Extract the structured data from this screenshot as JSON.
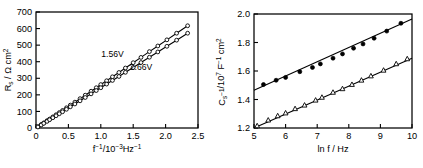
{
  "figure": {
    "background_color": "#ffffff",
    "line_color": "#000000",
    "panels": [
      "series-resistance-plot",
      "series-capacitance-plot"
    ]
  },
  "chart_data": [
    {
      "type": "scatter",
      "name": "series-resistance-plot",
      "title": "",
      "xlabel": "f⁻¹/10⁻³ Hz⁻¹",
      "ylabel": "Rₛ / Ω cm²",
      "xlim": [
        0,
        2.5
      ],
      "ylim": [
        0,
        700
      ],
      "xticks": [
        "0",
        "0.5",
        "1.0",
        "1.5",
        "2.0",
        "2.5"
      ],
      "xtick_values": [
        0,
        0.5,
        1.0,
        1.5,
        2.0,
        2.5
      ],
      "yticks": [
        "0",
        "100",
        "200",
        "300",
        "400",
        "500",
        "600",
        "700"
      ],
      "ytick_values": [
        0,
        100,
        200,
        300,
        400,
        500,
        600,
        700
      ],
      "grid": false,
      "legend_position": "inline-annotation",
      "annotations": [
        {
          "text": "1.56V",
          "x": 1.18,
          "y": 430
        },
        {
          "text": "2.66V",
          "x": 1.62,
          "y": 350
        }
      ],
      "series": [
        {
          "name": "1.56V",
          "marker": "circle-open",
          "label_text": "1.56V",
          "x": [
            0.03,
            0.08,
            0.12,
            0.17,
            0.21,
            0.26,
            0.31,
            0.36,
            0.41,
            0.47,
            0.53,
            0.6,
            0.68,
            0.76,
            0.85,
            0.93,
            1.0,
            1.09,
            1.18,
            1.28,
            1.38,
            1.5,
            1.62,
            1.75,
            1.88,
            2.02,
            2.17,
            2.34
          ],
          "y": [
            8,
            21,
            31,
            44,
            54,
            67,
            80,
            93,
            106,
            122,
            138,
            156,
            177,
            198,
            222,
            243,
            262,
            285,
            309,
            335,
            362,
            394,
            426,
            461,
            495,
            532,
            572,
            617
          ]
        },
        {
          "name": "2.66V",
          "marker": "circle-open",
          "label_text": "2.66V",
          "x": [
            0.03,
            0.08,
            0.12,
            0.17,
            0.21,
            0.26,
            0.31,
            0.36,
            0.41,
            0.47,
            0.53,
            0.6,
            0.68,
            0.76,
            0.85,
            0.93,
            1.0,
            1.09,
            1.18,
            1.28,
            1.38,
            1.5,
            1.62,
            1.75,
            1.88,
            2.02,
            2.17,
            2.34
          ],
          "y": [
            6,
            18,
            28,
            40,
            50,
            62,
            74,
            86,
            98,
            113,
            128,
            145,
            164,
            184,
            206,
            226,
            243,
            265,
            287,
            311,
            336,
            365,
            395,
            427,
            459,
            493,
            530,
            572
          ]
        }
      ]
    },
    {
      "type": "scatter",
      "name": "series-capacitance-plot",
      "title": "",
      "xlabel": "ln f / Hz",
      "ylabel": "Cₛ⁻¹/10⁷ F⁻¹ cm²",
      "xlim": [
        5,
        10
      ],
      "ylim": [
        1.2,
        2.0
      ],
      "xticks": [
        "5",
        "6",
        "7",
        "8",
        "9",
        "10"
      ],
      "xtick_values": [
        5,
        6,
        7,
        8,
        9,
        10
      ],
      "yticks": [
        "1.2",
        "1.4",
        "1.6",
        "1.8",
        "2.0"
      ],
      "ytick_values": [
        1.2,
        1.4,
        1.6,
        1.8,
        2.0
      ],
      "grid": false,
      "legend_position": "none",
      "annotations": [],
      "series": [
        {
          "name": "upper-branch",
          "marker": "circle-filled",
          "x": [
            5.3,
            5.7,
            6.0,
            6.45,
            6.85,
            7.1,
            7.5,
            7.8,
            8.15,
            8.45,
            8.8,
            9.2,
            9.65
          ],
          "y": [
            1.505,
            1.535,
            1.555,
            1.595,
            1.625,
            1.65,
            1.69,
            1.72,
            1.76,
            1.79,
            1.83,
            1.88,
            1.935
          ],
          "fit_line": {
            "x": [
              5.0,
              10.0
            ],
            "y": [
              1.465,
              1.965
            ]
          }
        },
        {
          "name": "lower-branch",
          "marker": "triangle-open",
          "x": [
            5.1,
            5.45,
            5.75,
            6.0,
            6.3,
            6.6,
            6.95,
            7.15,
            7.5,
            7.8,
            8.1,
            8.4,
            8.7,
            9.1,
            9.5,
            9.85
          ],
          "y": [
            1.215,
            1.255,
            1.285,
            1.305,
            1.335,
            1.36,
            1.395,
            1.415,
            1.45,
            1.475,
            1.505,
            1.535,
            1.565,
            1.605,
            1.65,
            1.685
          ],
          "fit_line": {
            "x": [
              5.0,
              10.0
            ],
            "y": [
              1.2,
              1.69
            ]
          }
        }
      ]
    }
  ]
}
